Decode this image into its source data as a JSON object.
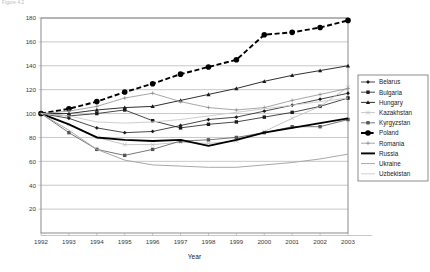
{
  "caption": "Figure 4.2",
  "chart_data": {
    "type": "line",
    "title": "",
    "xlabel": "Year",
    "ylabel": "",
    "grid": true,
    "legend_position": "right",
    "x": [
      1992,
      1993,
      1994,
      1995,
      1996,
      1997,
      1998,
      1999,
      2000,
      2001,
      2002,
      2003
    ],
    "categories": [
      "1992",
      "1993",
      "1994",
      "1995",
      "1996",
      "1997",
      "1998",
      "1999",
      "2000",
      "2001",
      "2002",
      "2003"
    ],
    "xlim": [
      1992,
      2003
    ],
    "ylim": [
      0,
      180
    ],
    "yticks": [
      0,
      20,
      40,
      60,
      80,
      100,
      120,
      140,
      160,
      180
    ],
    "ytick_labels": [
      "",
      "20",
      "40",
      "60",
      "80",
      "100",
      "120",
      "140",
      "160",
      "180"
    ],
    "series": [
      {
        "name": "Belarus",
        "color": "#1a1a1a",
        "width": 0.8,
        "dash": "none",
        "marker": "diamond",
        "marker_size": 1.9,
        "values": [
          100,
          96,
          88,
          84,
          85,
          90,
          95,
          97,
          102,
          107,
          112,
          117
        ]
      },
      {
        "name": "Bulgaria",
        "color": "#1a1a1a",
        "width": 0.8,
        "dash": "none",
        "marker": "square",
        "marker_size": 1.7,
        "values": [
          100,
          98,
          100,
          103,
          94,
          88,
          91,
          93,
          97,
          101,
          106,
          113
        ]
      },
      {
        "name": "Hungary",
        "color": "#1a1a1a",
        "width": 0.9,
        "dash": "none",
        "marker": "triangle",
        "marker_size": 2.1,
        "values": [
          100,
          100,
          103,
          105,
          106,
          111,
          116,
          121,
          127,
          132,
          136,
          140
        ]
      },
      {
        "name": "Kazakhstan",
        "color": "#b9b9b9",
        "width": 0.8,
        "dash": "none",
        "marker": "cross",
        "marker_size": 1.9,
        "values": [
          100,
          91,
          80,
          74,
          74,
          76,
          75,
          77,
          85,
          96,
          106,
          122
        ]
      },
      {
        "name": "Kyrgyzstan",
        "color": "#555555",
        "width": 0.8,
        "dash": "none",
        "marker": "square",
        "marker_size": 1.7,
        "values": [
          100,
          84,
          70,
          65,
          70,
          77,
          78,
          80,
          84,
          89,
          89,
          95
        ]
      },
      {
        "name": "Poland",
        "color": "#000000",
        "width": 1.9,
        "dash": "5,2.6",
        "marker": "circle",
        "marker_size": 2.8,
        "values": [
          100,
          104,
          110,
          118,
          125,
          133,
          139,
          145,
          166,
          168,
          172,
          178
        ]
      },
      {
        "name": "Romania",
        "color": "#8a8a8a",
        "width": 0.75,
        "dash": "none",
        "marker": "plus",
        "marker_size": 1.9,
        "values": [
          100,
          102,
          106,
          113,
          117,
          110,
          105,
          103,
          105,
          111,
          116,
          121
        ]
      },
      {
        "name": "Russia",
        "color": "#000000",
        "width": 1.9,
        "dash": "none",
        "marker": "none",
        "marker_size": 0,
        "values": [
          100,
          91,
          80,
          78,
          77,
          78,
          73,
          78,
          84,
          88,
          92,
          96
        ]
      },
      {
        "name": "Ukraine",
        "color": "#a8a8a8",
        "width": 1.0,
        "dash": "none",
        "marker": "none",
        "marker_size": 0,
        "values": [
          100,
          86,
          70,
          61,
          57,
          56,
          55,
          55,
          57,
          59,
          62,
          66
        ]
      },
      {
        "name": "Uzbekistan",
        "color": "#cfcfcf",
        "width": 1.0,
        "dash": "none",
        "marker": "none",
        "marker_size": 0,
        "values": [
          100,
          98,
          93,
          92,
          93,
          95,
          98,
          101,
          104,
          107,
          110,
          113
        ]
      }
    ]
  }
}
